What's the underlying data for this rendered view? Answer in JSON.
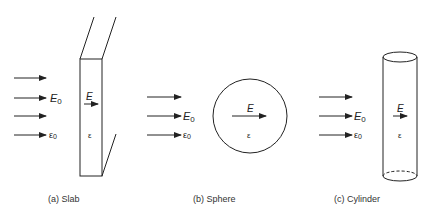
{
  "colors": {
    "stroke": "#222222",
    "background": "#ffffff"
  },
  "labels": {
    "incident_field": "E",
    "incident_field_sub": "0",
    "outside_permittivity": "ε",
    "outside_permittivity_sub": "0",
    "inside_field": "E",
    "inside_permittivity": "ε"
  },
  "panels": [
    {
      "id": "a",
      "caption": "(a)  Slab",
      "shape": "slab"
    },
    {
      "id": "b",
      "caption": "(b)  Sphere",
      "shape": "sphere"
    },
    {
      "id": "c",
      "caption": "(c)  Cylinder",
      "shape": "cylinder"
    }
  ]
}
